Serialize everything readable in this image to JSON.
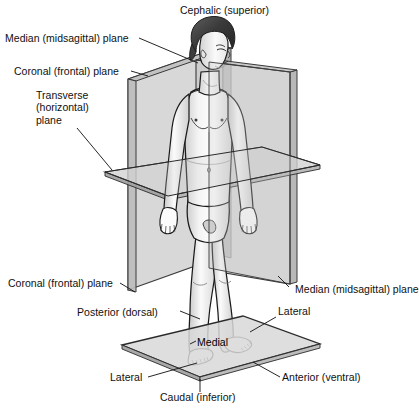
{
  "labels": {
    "cephalic": "Cephalic (superior)",
    "median_plane_top": "Median (midsagittal) plane",
    "coronal_plane_top": "Coronal (frontal) plane",
    "transverse_line1": "Transverse",
    "transverse_line2": "(horizontal)",
    "transverse_line3": "plane",
    "coronal_plane_bottom": "Coronal (frontal) plane",
    "median_plane_bottom": "Median (midsagittal) plane",
    "posterior": "Posterior (dorsal)",
    "lateral_right": "Lateral",
    "lateral_left": "Lateral",
    "medial": "Medial",
    "anterior": "Anterior (ventral)",
    "caudal": "Caudal (inferior)"
  },
  "colors": {
    "ink": "#101010",
    "outline": "#1a1a1a",
    "plane_fill_light": "#d9d9d9",
    "plane_fill_mid": "#c2c2c2",
    "plane_fill_dark": "#b0b0b0",
    "plane_edge": "#2b2b2b",
    "skin_light": "#ffffff",
    "skin_shade": "#d8d8d8",
    "hair_dark": "#4a4a4a",
    "hair_darkest": "#2e2e2e",
    "background": "#ffffff"
  },
  "planes": [
    {
      "name": "coronal-frontal-plane",
      "orientation": "vertical-frontal"
    },
    {
      "name": "median-midsagittal-plane",
      "orientation": "vertical-sagittal"
    },
    {
      "name": "transverse-horizontal-plane",
      "orientation": "horizontal"
    },
    {
      "name": "base-platform",
      "orientation": "horizontal-ground"
    }
  ]
}
